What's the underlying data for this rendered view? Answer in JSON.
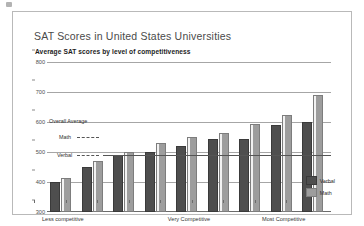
{
  "figure": {
    "title": "SAT Scores in United States Universities",
    "subtitle": "Average SAT scores by level of competitiveness"
  },
  "annotations": {
    "overall_average": "Overall Average",
    "math": "Math",
    "verbal": "Verbal"
  },
  "legend": {
    "verbal": "Verbal",
    "math": "Math"
  },
  "colors": {
    "verbal_bar": "#4e4e4e",
    "math_bar": "#9d9d9d",
    "gridline": "#a6a6a6",
    "frame": "#b9b9b9",
    "title_text": "#4a4a4a"
  },
  "chart_data": {
    "type": "bar",
    "title": "SAT Scores in United States Universities",
    "subtitle": "Average SAT scores by level of competitiveness",
    "xlabel": "",
    "ylabel": "",
    "ylim": [
      300,
      800
    ],
    "yticks": [
      300,
      400,
      500,
      600,
      700,
      800
    ],
    "grid": true,
    "legend_position": "bottom-right",
    "categories": [
      "1",
      "2",
      "3",
      "4",
      "5",
      "6",
      "7",
      "8",
      "9"
    ],
    "group_axis_labels": [
      {
        "label": "Less competitive",
        "at_group": 1
      },
      {
        "label": "Very Competitive",
        "at_group": 5
      },
      {
        "label": "Most Competitive",
        "at_group": 8
      }
    ],
    "series": [
      {
        "name": "Verbal",
        "values": [
          400,
          450,
          490,
          500,
          520,
          545,
          545,
          590,
          600
        ]
      },
      {
        "name": "Math",
        "values": [
          415,
          470,
          500,
          530,
          550,
          565,
          595,
          625,
          690
        ]
      }
    ],
    "reference_lines": [
      {
        "name": "Overall Average",
        "y": 600
      },
      {
        "name": "Math",
        "y": 560
      },
      {
        "name": "Verbal",
        "y": 520
      }
    ]
  }
}
